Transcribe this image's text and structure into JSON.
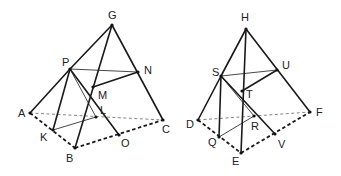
{
  "figures": [
    {
      "name": "tetrahedron-G-ABC",
      "points": {
        "G": {
          "x": 112,
          "y": 25,
          "lx": 108,
          "ly": 19
        },
        "P": {
          "x": 70,
          "y": 69,
          "lx": 62,
          "ly": 66
        },
        "N": {
          "x": 138,
          "y": 72,
          "lx": 144,
          "ly": 74
        },
        "M": {
          "x": 93,
          "y": 87,
          "lx": 98,
          "ly": 99
        },
        "A": {
          "x": 30,
          "y": 113,
          "lx": 18,
          "ly": 117
        },
        "L": {
          "x": 96,
          "y": 117,
          "lx": 100,
          "ly": 114
        },
        "C": {
          "x": 163,
          "y": 120,
          "lx": 162,
          "ly": 133
        },
        "K": {
          "x": 53,
          "y": 130,
          "lx": 40,
          "ly": 141
        },
        "O": {
          "x": 119,
          "y": 135,
          "lx": 121,
          "ly": 147
        },
        "B": {
          "x": 75,
          "y": 148,
          "lx": 66,
          "ly": 162
        }
      },
      "solid_edges": [
        [
          "G",
          "P"
        ],
        [
          "P",
          "A"
        ],
        [
          "G",
          "C"
        ],
        [
          "G",
          "B"
        ],
        [
          "P",
          "K"
        ],
        [
          "P",
          "O"
        ],
        [
          "M",
          "N"
        ]
      ],
      "thin_edges": [
        [
          "P",
          "N"
        ],
        [
          "P",
          "L"
        ],
        [
          "K",
          "L"
        ]
      ],
      "dashed_thick": [
        [
          "A",
          "B"
        ],
        [
          "B",
          "C"
        ]
      ],
      "dashed_thin": [
        [
          "A",
          "C"
        ]
      ]
    },
    {
      "name": "tetrahedron-H-DEF",
      "points": {
        "H": {
          "x": 246,
          "y": 29,
          "lx": 241,
          "ly": 21
        },
        "S": {
          "x": 221,
          "y": 76,
          "lx": 212,
          "ly": 76
        },
        "U": {
          "x": 277,
          "y": 70,
          "lx": 282,
          "ly": 69
        },
        "T": {
          "x": 242,
          "y": 91,
          "lx": 246,
          "ly": 98
        },
        "D": {
          "x": 198,
          "y": 120,
          "lx": 186,
          "ly": 128
        },
        "R": {
          "x": 254,
          "y": 116,
          "lx": 251,
          "ly": 130
        },
        "F": {
          "x": 310,
          "y": 112,
          "lx": 316,
          "ly": 116
        },
        "Q": {
          "x": 219,
          "y": 137,
          "lx": 208,
          "ly": 146
        },
        "V": {
          "x": 275,
          "y": 134,
          "lx": 278,
          "ly": 148
        },
        "E": {
          "x": 241,
          "y": 153,
          "lx": 232,
          "ly": 165
        }
      },
      "solid_edges": [
        [
          "H",
          "S"
        ],
        [
          "S",
          "D"
        ],
        [
          "H",
          "F"
        ],
        [
          "H",
          "E"
        ],
        [
          "S",
          "Q"
        ],
        [
          "S",
          "V"
        ],
        [
          "T",
          "U"
        ]
      ],
      "thin_edges": [
        [
          "S",
          "U"
        ],
        [
          "S",
          "R"
        ],
        [
          "Q",
          "R"
        ]
      ],
      "dashed_thick": [
        [
          "D",
          "E"
        ],
        [
          "E",
          "F"
        ]
      ],
      "dashed_thin": [
        [
          "D",
          "F"
        ]
      ]
    }
  ]
}
